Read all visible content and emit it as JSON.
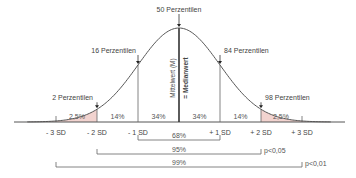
{
  "chart_data": {
    "type": "area",
    "title": "",
    "distribution": "normal",
    "mean": 0,
    "sd": 1,
    "x_range_sd": [
      -3.7,
      3.7
    ],
    "xlabel": "",
    "ylabel": "",
    "grid": false,
    "x_ticks": [
      {
        "value": -3,
        "label": "- 3 SD"
      },
      {
        "value": -2,
        "label": "- 2 SD"
      },
      {
        "value": -1,
        "label": "- 1 SD"
      },
      {
        "value": 1,
        "label": "+ 1 SD"
      },
      {
        "value": 2,
        "label": "+ 2 SD"
      },
      {
        "value": 3,
        "label": "+ 3 SD"
      }
    ],
    "vertical_lines_sd": [
      -2,
      -1,
      0,
      1,
      2
    ],
    "shaded_tails": [
      {
        "from": -3.7,
        "to": -2,
        "label": "2,5%"
      },
      {
        "from": 2,
        "to": 3.7,
        "label": "2,5%"
      }
    ],
    "shade_color": "#f2d3cf",
    "curve_color": "#555555",
    "area_labels": [
      {
        "from": -2,
        "to": -1,
        "label": "14%"
      },
      {
        "from": -1,
        "to": 0,
        "label": "34%"
      },
      {
        "from": 0,
        "to": 1,
        "label": "34%"
      },
      {
        "from": 1,
        "to": 2,
        "label": "14%"
      }
    ],
    "percentile_annotations": [
      {
        "sd": -2,
        "label": "2 Perzentilen"
      },
      {
        "sd": -1,
        "label": "16 Perzentilen"
      },
      {
        "sd": 0,
        "label": "50 Perzentilen"
      },
      {
        "sd": 1,
        "label": "84 Perzentilen"
      },
      {
        "sd": 2,
        "label": "98 Perzentilen"
      }
    ],
    "mean_line_labels": {
      "left": "Mittelwert (M)",
      "right": "= Medianwert"
    },
    "brackets": [
      {
        "from": -1,
        "to": 1,
        "label": "68%",
        "note": ""
      },
      {
        "from": -2,
        "to": 2,
        "label": "95%",
        "note": "p<0,05"
      },
      {
        "from": -3,
        "to": 3,
        "label": "99%",
        "note": "p<0,01"
      }
    ]
  }
}
